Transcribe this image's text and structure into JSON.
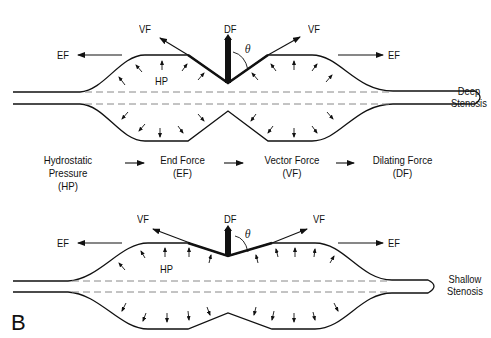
{
  "top_diagram": {
    "labels": {
      "vf_left": "VF",
      "df": "DF",
      "vf_right": "VF",
      "theta": "θ",
      "ef_left": "EF",
      "ef_right": "EF",
      "hp": "HP"
    },
    "caption": [
      "Deep",
      "Stenosis"
    ]
  },
  "flow": [
    {
      "name": "Hydrostatic Pressure",
      "abbr": "(HP)"
    },
    {
      "name": "End Force",
      "abbr": "(EF)"
    },
    {
      "name": "Vector Force",
      "abbr": "(VF)"
    },
    {
      "name": "Dilating Force",
      "abbr": "(DF)"
    }
  ],
  "bottom_diagram": {
    "labels": {
      "vf_left": "VF",
      "df": "DF",
      "vf_right": "VF",
      "theta": "θ",
      "ef_left": "EF",
      "ef_right": "EF",
      "hp": "HP"
    },
    "caption": [
      "Shallow",
      "Stenosis"
    ]
  },
  "panel_label": "B"
}
